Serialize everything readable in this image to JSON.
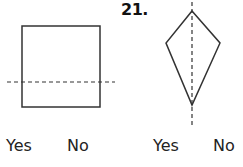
{
  "problem_number": "21.",
  "figures": [
    {
      "shape": "square",
      "line": "horizontal dashed line",
      "answers": {
        "yes": "Yes",
        "no": "No"
      }
    },
    {
      "shape": "kite",
      "line": "vertical dashed line",
      "answers": {
        "yes": "Yes",
        "no": "No"
      }
    }
  ]
}
